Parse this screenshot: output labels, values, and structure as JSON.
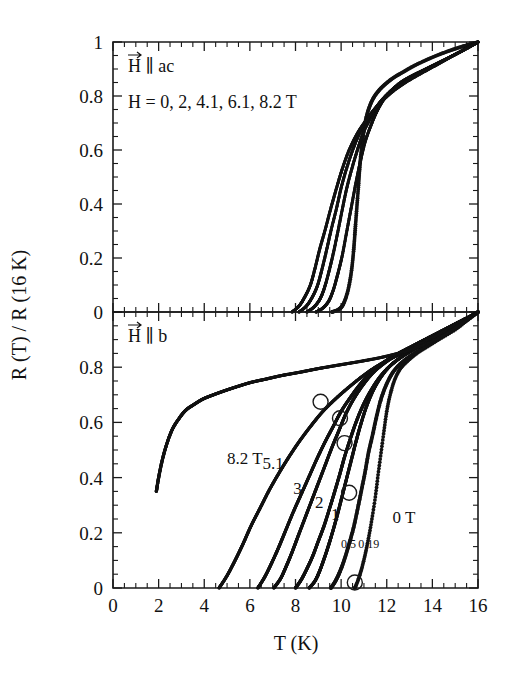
{
  "figure": {
    "title": "",
    "background_color": "#ffffff",
    "ink_color": "#121212"
  },
  "axes": {
    "x_title": "T (K)",
    "y_title": "R (T) / R (16 K)",
    "x_ticks": [
      "0",
      "2",
      "4",
      "6",
      "8",
      "10",
      "12",
      "14",
      "16"
    ],
    "y_ticks_top": [
      "0",
      "0.2",
      "0.4",
      "0.6",
      "0.8",
      "1"
    ],
    "y_ticks_bottom": [
      "0",
      "0.2",
      "0.4",
      "0.6",
      "0.8",
      "0"
    ]
  },
  "panels": {
    "top": {
      "annotation_orientation": "H ∥ ac",
      "annotation_fields": "H = 0, 2, 4.1, 6.1, 8.2 T"
    },
    "bottom": {
      "annotation_orientation": "H ∥ b",
      "curve_labels": [
        {
          "text": "8.2 T",
          "x": 5.0,
          "y": 0.45
        },
        {
          "text": "5.1",
          "x": 6.55,
          "y": 0.43
        },
        {
          "text": "3",
          "x": 7.9,
          "y": 0.34
        },
        {
          "text": "2",
          "x": 8.85,
          "y": 0.29
        },
        {
          "text": "1",
          "x": 9.55,
          "y": 0.245
        },
        {
          "text": "0.5",
          "x": 10.0,
          "y": 0.145
        },
        {
          "text": "0.19",
          "x": 10.75,
          "y": 0.145
        },
        {
          "text": "0 T",
          "x": 12.25,
          "y": 0.235
        }
      ]
    }
  },
  "chart_data": {
    "type": "scatter",
    "title": "",
    "xlabel": "T (K)",
    "ylabel": "R (T) / R (16 K)",
    "xlim": [
      0,
      16
    ],
    "ylim": [
      0,
      1
    ],
    "grid": false,
    "legend": "inline-curve-labels",
    "x_major_step": 2,
    "x_minor_step": 0.5,
    "y_major_step": 0.2,
    "y_minor_step": 0.05,
    "panels": [
      {
        "name": "top",
        "annotation": "H ∥ ac",
        "field_list": "H = 0, 2, 4.1, 6.1, 8.2 T",
        "ylim": [
          0,
          1
        ],
        "series": [
          {
            "name": "0 T",
            "field_tesla": 0,
            "x": [
              9.6,
              9.9,
              10.1,
              10.3,
              10.45,
              10.55,
              10.62,
              10.7,
              10.78,
              10.85,
              10.95,
              11.05,
              11.2,
              11.4,
              11.65,
              11.95,
              12.3,
              12.7,
              13.2,
              13.8,
              14.4,
              15.0,
              15.5,
              16.0
            ],
            "y": [
              0.0,
              0.01,
              0.03,
              0.08,
              0.15,
              0.23,
              0.31,
              0.4,
              0.49,
              0.57,
              0.64,
              0.7,
              0.75,
              0.79,
              0.82,
              0.845,
              0.868,
              0.888,
              0.912,
              0.936,
              0.957,
              0.975,
              0.988,
              1.0
            ]
          },
          {
            "name": "2 T",
            "field_tesla": 2,
            "x": [
              8.9,
              9.2,
              9.45,
              9.65,
              9.85,
              10.05,
              10.25,
              10.45,
              10.65,
              10.85,
              11.05,
              11.3,
              11.55,
              11.85,
              12.2,
              12.6,
              13.1,
              13.7,
              14.3,
              14.9,
              15.45,
              16.0
            ],
            "y": [
              0.0,
              0.015,
              0.04,
              0.08,
              0.14,
              0.21,
              0.3,
              0.39,
              0.48,
              0.56,
              0.63,
              0.69,
              0.74,
              0.785,
              0.82,
              0.85,
              0.875,
              0.9,
              0.925,
              0.95,
              0.975,
              1.0
            ]
          },
          {
            "name": "4.1 T",
            "field_tesla": 4.1,
            "x": [
              8.5,
              8.8,
              9.05,
              9.25,
              9.45,
              9.65,
              9.85,
              10.05,
              10.25,
              10.5,
              10.75,
              11.0,
              11.3,
              11.6,
              12.0,
              12.45,
              13.0,
              13.6,
              14.25,
              14.9,
              15.45,
              16.0
            ],
            "y": [
              0.0,
              0.018,
              0.045,
              0.085,
              0.145,
              0.215,
              0.295,
              0.38,
              0.46,
              0.54,
              0.61,
              0.67,
              0.72,
              0.765,
              0.805,
              0.838,
              0.866,
              0.893,
              0.921,
              0.949,
              0.974,
              1.0
            ]
          },
          {
            "name": "6.1 T",
            "field_tesla": 6.1,
            "x": [
              8.15,
              8.45,
              8.7,
              8.95,
              9.15,
              9.35,
              9.55,
              9.8,
              10.0,
              10.25,
              10.55,
              10.85,
              11.15,
              11.5,
              11.9,
              12.4,
              12.95,
              13.55,
              14.2,
              14.85,
              15.45,
              16.0
            ],
            "y": [
              0.0,
              0.02,
              0.05,
              0.095,
              0.155,
              0.225,
              0.3,
              0.385,
              0.46,
              0.535,
              0.61,
              0.67,
              0.715,
              0.755,
              0.795,
              0.83,
              0.86,
              0.888,
              0.918,
              0.948,
              0.974,
              1.0
            ]
          },
          {
            "name": "8.2 T",
            "field_tesla": 8.2,
            "x": [
              7.85,
              8.15,
              8.4,
              8.65,
              8.85,
              9.05,
              9.3,
              9.55,
              9.8,
              10.05,
              10.35,
              10.7,
              11.05,
              11.45,
              11.9,
              12.4,
              12.95,
              13.55,
              14.2,
              14.85,
              15.45,
              16.0
            ],
            "y": [
              0.0,
              0.022,
              0.055,
              0.1,
              0.16,
              0.23,
              0.305,
              0.385,
              0.46,
              0.53,
              0.6,
              0.66,
              0.705,
              0.75,
              0.79,
              0.826,
              0.857,
              0.886,
              0.916,
              0.947,
              0.974,
              1.0
            ]
          }
        ]
      },
      {
        "name": "bottom",
        "annotation": "H ∥ b",
        "ylim": [
          0,
          1
        ],
        "series": [
          {
            "name": "0 T",
            "field_tesla": 0,
            "label": "0 T",
            "x": [
              10.6,
              10.75,
              10.9,
              11.05,
              11.2,
              11.35,
              11.5,
              11.62,
              11.75,
              11.88,
              12.0,
              12.15,
              12.35,
              12.6,
              12.95,
              13.35,
              13.85,
              14.4,
              15.0,
              15.5,
              16.0
            ],
            "y": [
              0.0,
              0.03,
              0.07,
              0.12,
              0.18,
              0.25,
              0.33,
              0.41,
              0.49,
              0.57,
              0.64,
              0.7,
              0.755,
              0.795,
              0.825,
              0.852,
              0.878,
              0.906,
              0.936,
              0.968,
              1.0
            ]
          },
          {
            "name": "0.19 T",
            "field_tesla": 0.19,
            "label": "0.19",
            "x": [
              9.55,
              9.75,
              9.95,
              10.15,
              10.35,
              10.55,
              10.72,
              10.88,
              11.05,
              11.2,
              11.38,
              11.55,
              11.75,
              12.0,
              12.3,
              12.7,
              13.2,
              13.8,
              14.45,
              15.05,
              15.55,
              16.0
            ],
            "y": [
              0.0,
              0.025,
              0.06,
              0.105,
              0.16,
              0.22,
              0.285,
              0.35,
              0.42,
              0.49,
              0.555,
              0.62,
              0.685,
              0.74,
              0.785,
              0.82,
              0.85,
              0.88,
              0.912,
              0.944,
              0.972,
              1.0
            ]
          },
          {
            "name": "0.5 T",
            "field_tesla": 0.5,
            "label": "0.5",
            "x": [
              8.6,
              8.85,
              9.05,
              9.25,
              9.45,
              9.65,
              9.85,
              10.05,
              10.25,
              10.45,
              10.65,
              10.85,
              11.1,
              11.4,
              11.75,
              12.15,
              12.65,
              13.25,
              13.95,
              14.65,
              15.35,
              16.0
            ],
            "y": [
              0.0,
              0.025,
              0.06,
              0.105,
              0.155,
              0.21,
              0.27,
              0.335,
              0.4,
              0.465,
              0.53,
              0.59,
              0.655,
              0.715,
              0.765,
              0.805,
              0.838,
              0.868,
              0.9,
              0.934,
              0.968,
              1.0
            ]
          },
          {
            "name": "1 T",
            "field_tesla": 1,
            "label": "1",
            "x": [
              8.0,
              8.25,
              8.5,
              8.75,
              9.0,
              9.25,
              9.5,
              9.72,
              9.95,
              10.15,
              10.4,
              10.65,
              10.95,
              11.3,
              11.7,
              12.15,
              12.7,
              13.3,
              14.0,
              14.7,
              15.35,
              16.0
            ],
            "y": [
              0.0,
              0.03,
              0.07,
              0.115,
              0.17,
              0.225,
              0.29,
              0.35,
              0.415,
              0.475,
              0.54,
              0.6,
              0.66,
              0.715,
              0.765,
              0.805,
              0.84,
              0.87,
              0.902,
              0.936,
              0.968,
              1.0
            ]
          },
          {
            "name": "2 T",
            "field_tesla": 2,
            "label": "2",
            "x": [
              7.05,
              7.35,
              7.6,
              7.85,
              8.1,
              8.4,
              8.7,
              9.0,
              9.3,
              9.6,
              9.9,
              10.2,
              10.55,
              10.95,
              11.4,
              11.9,
              12.45,
              13.1,
              13.8,
              14.5,
              15.25,
              16.0
            ],
            "y": [
              0.0,
              0.035,
              0.08,
              0.13,
              0.185,
              0.25,
              0.315,
              0.38,
              0.445,
              0.51,
              0.57,
              0.63,
              0.685,
              0.735,
              0.78,
              0.815,
              0.845,
              0.875,
              0.905,
              0.935,
              0.967,
              1.0
            ]
          },
          {
            "name": "3 T",
            "field_tesla": 3,
            "label": "3",
            "x": [
              6.35,
              6.65,
              6.95,
              7.25,
              7.55,
              7.9,
              8.25,
              8.6,
              8.95,
              9.3,
              9.65,
              10.0,
              10.4,
              10.85,
              11.35,
              11.9,
              12.5,
              13.15,
              13.85,
              14.6,
              15.3,
              16.0
            ],
            "y": [
              0.0,
              0.04,
              0.09,
              0.145,
              0.205,
              0.275,
              0.34,
              0.405,
              0.47,
              0.53,
              0.585,
              0.64,
              0.69,
              0.74,
              0.785,
              0.82,
              0.85,
              0.878,
              0.908,
              0.94,
              0.97,
              1.0
            ]
          },
          {
            "name": "5.1 T",
            "field_tesla": 5.1,
            "label": "5.1",
            "x": [
              4.65,
              5.0,
              5.35,
              5.7,
              6.05,
              6.45,
              6.85,
              7.3,
              7.75,
              8.2,
              8.7,
              9.2,
              9.75,
              10.3,
              10.9,
              11.5,
              12.15,
              12.85,
              13.6,
              14.4,
              15.2,
              16.0
            ],
            "y": [
              0.0,
              0.045,
              0.1,
              0.16,
              0.225,
              0.29,
              0.355,
              0.42,
              0.48,
              0.535,
              0.59,
              0.64,
              0.685,
              0.725,
              0.765,
              0.8,
              0.83,
              0.858,
              0.89,
              0.925,
              0.962,
              1.0
            ]
          },
          {
            "name": "8.2 T",
            "field_tesla": 8.2,
            "label": "8.2 T",
            "x": [
              1.9,
              2.0,
              2.15,
              2.35,
              2.6,
              2.9,
              3.2,
              3.55,
              3.95,
              4.4,
              4.9,
              5.45,
              6.05,
              6.7,
              7.4,
              8.2,
              9.0,
              9.9,
              10.9,
              12.0,
              13.2,
              14.5,
              16.0
            ],
            "y": [
              0.35,
              0.4,
              0.46,
              0.52,
              0.575,
              0.615,
              0.645,
              0.665,
              0.685,
              0.7,
              0.715,
              0.73,
              0.745,
              0.757,
              0.77,
              0.782,
              0.795,
              0.808,
              0.822,
              0.84,
              0.868,
              0.915,
              1.0
            ]
          }
        ],
        "markers": [
          {
            "shape": "open-circle",
            "x": 9.1,
            "y": 0.675
          },
          {
            "shape": "open-circle",
            "x": 9.95,
            "y": 0.615
          },
          {
            "shape": "open-circle",
            "x": 10.15,
            "y": 0.525
          },
          {
            "shape": "open-circle",
            "x": 10.35,
            "y": 0.345
          },
          {
            "shape": "open-circle",
            "x": 10.6,
            "y": 0.02
          }
        ]
      }
    ]
  }
}
